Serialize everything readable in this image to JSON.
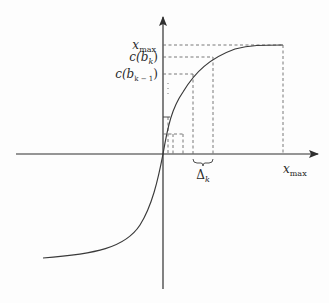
{
  "diagram": {
    "axes": {
      "x_axis_label": "x",
      "x_axis_sub": "max",
      "y_labels": [
        {
          "main": "x",
          "sub": "max",
          "y": 45
        },
        {
          "main": "c(b",
          "sub": "k",
          "tail": ")",
          "y": 57
        },
        {
          "main": "c(b",
          "sub": "k − 1",
          "tail": ")",
          "y": 74
        }
      ]
    },
    "interval_label": {
      "main": "Δ",
      "sub": "k"
    },
    "colors": {
      "curve": "#3a3a3a",
      "axis": "#2f2f2f",
      "dashed": "#6a6a6a",
      "text": "#2a2a2a"
    }
  }
}
